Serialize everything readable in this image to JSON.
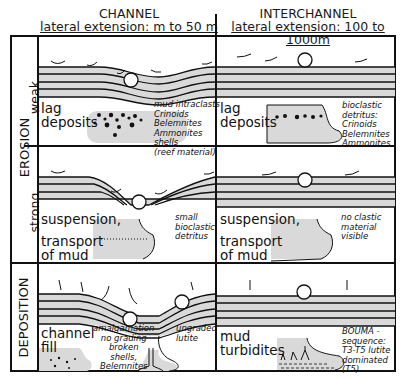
{
  "columns": [
    {
      "title": "CHANNEL",
      "subtitle": "lateral extension: m to 50 m"
    },
    {
      "title": "INTERCHANNEL",
      "subtitle": "lateral extension: 100 to 1000m"
    }
  ],
  "row_groups": [
    {
      "label": "EROSION",
      "subrows": [
        "weak",
        "strong"
      ]
    },
    {
      "label": "DEPOSITION",
      "subrows": []
    }
  ],
  "cells": {
    "weak_channel": {
      "process": [
        "lag",
        "deposits"
      ],
      "notes": [
        "mud intraclasts",
        "Crinoids",
        "Belemnites",
        "Ammonites",
        "shells",
        "(reef material)"
      ]
    },
    "weak_interchannel": {
      "process": [
        "lag",
        "deposits"
      ],
      "notes": [
        "bioclastic",
        "detritus:",
        "Crinoids",
        "Belemnites",
        "Ammonites"
      ]
    },
    "strong_channel": {
      "process": [
        "suspension,",
        "transport",
        "of mud"
      ],
      "notes": [
        "small",
        "bioclastic",
        "detritus"
      ]
    },
    "strong_interchannel": {
      "process": [
        "suspension,",
        "transport",
        "of mud"
      ],
      "notes": [
        "no clastic",
        "material",
        "visible"
      ]
    },
    "deposition_channel": {
      "process": [
        "channel",
        "fill"
      ],
      "notes": [
        "amalgamation",
        "no grading",
        "broken",
        "shells,",
        "Belemnites"
      ],
      "notes2": [
        "ungraded",
        "lutite"
      ]
    },
    "deposition_interchannel": {
      "process": [
        "mud",
        "turbidites"
      ],
      "notes": [
        "BOUMA -",
        "sequence:",
        "T3-T5 lutite",
        "dominated",
        "(T5)"
      ]
    }
  },
  "colors": {
    "line": "#111111",
    "fill": "#d9d9d9",
    "background": "#ffffff"
  }
}
